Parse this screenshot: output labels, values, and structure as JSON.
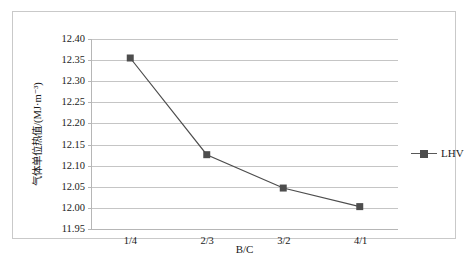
{
  "chart_data": {
    "type": "line",
    "title": "",
    "xlabel": "B/C",
    "ylabel": "气体单位热值/(MJ·m⁻³)",
    "categories": [
      "1/4",
      "2/3",
      "3/2",
      "4/1"
    ],
    "series": [
      {
        "name": "LHV",
        "values": [
          12.355,
          12.126,
          12.047,
          12.003
        ],
        "color": "#4d4d4d",
        "marker": "square"
      }
    ],
    "ylim": [
      11.95,
      12.4
    ],
    "ytick_labels": [
      "12.40",
      "12.35",
      "12.30",
      "12.25",
      "12.20",
      "12.15",
      "12.10",
      "12.05",
      "12.00",
      "11.95"
    ],
    "ytick_values": [
      12.4,
      12.35,
      12.3,
      12.25,
      12.2,
      12.15,
      12.1,
      12.05,
      12.0,
      11.95
    ],
    "grid": true,
    "legend_position": "right",
    "legend_entries": [
      "LHV"
    ]
  },
  "colors": {
    "series": "#4d4d4d",
    "gridline": "#c5c5c5",
    "axis": "#b6b6b6",
    "frame": "#c9c9c9",
    "text": "#1a1a1a",
    "background": "#ffffff"
  }
}
